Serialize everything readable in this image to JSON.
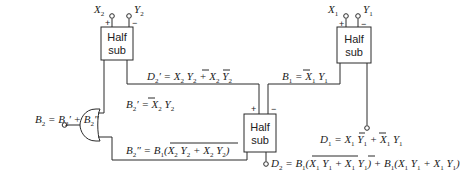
{
  "diagram": {
    "blocks": [
      {
        "id": "hs_top_left",
        "label_line1": "Half",
        "label_line2": "sub",
        "inputs": [
          "X2",
          "Y2"
        ]
      },
      {
        "id": "hs_top_right",
        "label_line1": "Half",
        "label_line2": "sub",
        "inputs": [
          "X1",
          "Y1"
        ]
      },
      {
        "id": "hs_middle",
        "label_line1": "Half",
        "label_line2": "sub",
        "inputs": [
          "D2'",
          "B1"
        ]
      }
    ],
    "gate": {
      "type": "OR",
      "output": "B2"
    },
    "inputs": {
      "x2": "X",
      "x2_sub": "2",
      "y2": "Y",
      "y2_sub": "2",
      "x1": "X",
      "x1_sub": "1",
      "y1": "Y",
      "y1_sub": "1"
    },
    "signs": {
      "plus": "+",
      "minus": "−"
    },
    "equations": {
      "d2_prime": "D2' = X2 Ȳ2 + X̄2 Y2",
      "b1": "B1 = X̄1 Y1",
      "b2_prime": "B2' = X̄2 Y2",
      "b2_double_prime": "B2'' = B1 (X2 Ȳ2 + X̄2 Y2)‾",
      "b2": "B2 = B2' + B2''",
      "d1": "D1 = X1 Ȳ1 + X̄1 Y1",
      "d2": "D2 = B1 (X1 Ȳ1 + X̄1 Y1)‾ + B̄1 (X1 Ȳ1 + X̄1 Y1)"
    }
  }
}
